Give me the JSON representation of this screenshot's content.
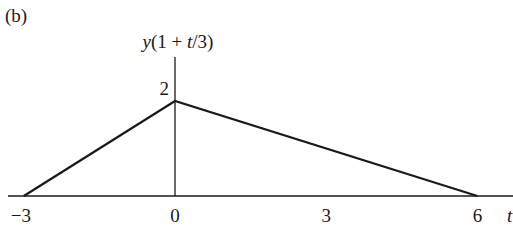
{
  "chart_data": {
    "type": "line",
    "panel_label": "(b)",
    "title": "",
    "xlabel": "t",
    "ylabel": "y(1 + t/3)",
    "ylabel_parts": {
      "y": "y",
      "open": "(1 + ",
      "t": "t",
      "close": "/3)"
    },
    "xlim": [
      -3.1,
      6.9
    ],
    "ylim": [
      0,
      2.9
    ],
    "grid": false,
    "legend": "none",
    "x_ticks": [
      -3,
      0,
      3,
      6
    ],
    "x_tick_labels": [
      "−3",
      "0",
      "3",
      "6"
    ],
    "y_ticks": [
      2
    ],
    "y_tick_labels": [
      "2"
    ],
    "series": [
      {
        "name": "y(1 + t/3)",
        "x": [
          -3,
          0,
          6
        ],
        "y": [
          0,
          2,
          0
        ]
      }
    ],
    "color": "#1a1a1a"
  }
}
